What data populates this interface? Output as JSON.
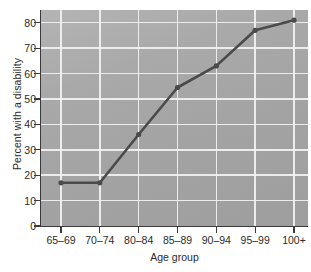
{
  "chart_data": {
    "type": "line",
    "title": "",
    "subtitle": "",
    "xlabel": "Age group",
    "ylabel": "Percent with a disability",
    "categories": [
      "65–69",
      "70–74",
      "80–84",
      "85–89",
      "90–94",
      "95–99",
      "100+"
    ],
    "values": [
      17,
      17,
      36,
      54.5,
      63,
      77,
      81
    ],
    "series": [
      {
        "name": "Percent with a disability",
        "values": [
          17,
          17,
          36,
          54.5,
          63,
          77,
          81
        ]
      }
    ],
    "ylim": [
      0,
      85
    ],
    "xlim": [
      0,
      6
    ],
    "yticks": [
      0,
      10,
      20,
      30,
      40,
      50,
      60,
      70,
      80
    ],
    "ytick_labels": [
      "0",
      "10",
      "20",
      "30",
      "40",
      "50",
      "60",
      "70",
      "80"
    ],
    "xtick_labels": [
      "65–69",
      "70–74",
      "80–84",
      "85–89",
      "90–94",
      "95–99",
      "100+"
    ],
    "grid": "both",
    "legend": "none",
    "annotations": [],
    "marker": "circle",
    "line_color": "#4a4a4a",
    "marker_color": "#4a4a4a",
    "plot_background": "#a9a9a9",
    "gridline_color": "#f2f2f2",
    "axis_color": "#3a3a3a",
    "page_background": "#ffffff",
    "text_color": "#2b2b2b"
  }
}
